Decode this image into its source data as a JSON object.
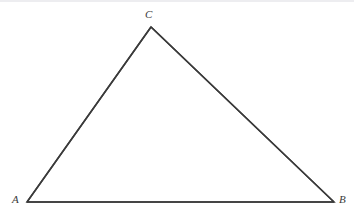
{
  "figure": {
    "type": "geometry-diagram",
    "shape": "triangle",
    "background_color": "#ffffff",
    "stroke_color": "#3a3a3a",
    "stroke_width": 1.5,
    "canvas": {
      "width": 354,
      "height": 217
    },
    "vertices": [
      {
        "id": "A",
        "label": "A",
        "x": 27,
        "y": 202,
        "label_x": 17,
        "label_y": 200
      },
      {
        "id": "B",
        "label": "B",
        "x": 334,
        "y": 202,
        "label_x": 343,
        "label_y": 200
      },
      {
        "id": "C",
        "label": "C",
        "x": 151,
        "y": 27,
        "label_x": 149,
        "label_y": 15
      }
    ],
    "edges": [
      {
        "id": "AC",
        "from": "A",
        "to": "C"
      },
      {
        "id": "CB",
        "from": "C",
        "to": "B"
      },
      {
        "id": "AB",
        "from": "A",
        "to": "B"
      }
    ],
    "path": "M 27 202 L 151 27 L 334 202 Z",
    "artifact": {
      "name": "top-edge-line",
      "color": "#ededf0"
    }
  }
}
